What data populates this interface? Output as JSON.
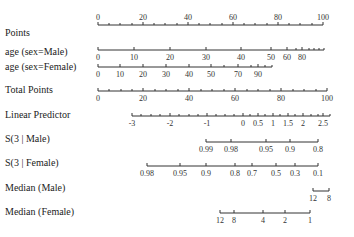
{
  "chart_data": {
    "type": "nomogram",
    "title": "",
    "axes": [
      {
        "label": "Points",
        "y": 25,
        "label_pos": "above",
        "start": 98,
        "end": 323,
        "ticks": [
          {
            "v": "0",
            "x": 98
          },
          {
            "v": "20",
            "x": 143
          },
          {
            "v": "40",
            "x": 188
          },
          {
            "v": "60",
            "x": 233
          },
          {
            "v": "80",
            "x": 278
          },
          {
            "v": "100",
            "x": 323
          }
        ],
        "minor": [
          109,
          120,
          132,
          154,
          165,
          177,
          199,
          210,
          222,
          244,
          255,
          267,
          289,
          300,
          312
        ]
      },
      {
        "label": "age (sex=Male)",
        "y": 50,
        "label_pos": "below",
        "start": 98,
        "end": 324,
        "ticks": [
          {
            "v": "0",
            "x": 98
          },
          {
            "v": "10",
            "x": 134
          },
          {
            "v": "20",
            "x": 170
          },
          {
            "v": "30",
            "x": 206
          },
          {
            "v": "40",
            "x": 241
          },
          {
            "v": "50",
            "x": 271
          },
          {
            "v": "60",
            "x": 287
          },
          {
            "v": "80",
            "x": 302
          }
        ],
        "minor": [
          296,
          309,
          314,
          319,
          324
        ]
      },
      {
        "label": "age (sex=Female)",
        "y": 67,
        "label_pos": "below",
        "start": 98,
        "end": 272,
        "ticks": [
          {
            "v": "0",
            "x": 98
          },
          {
            "v": "10",
            "x": 120
          },
          {
            "v": "20",
            "x": 143
          },
          {
            "v": "30",
            "x": 166
          },
          {
            "v": "40",
            "x": 189
          },
          {
            "v": "50",
            "x": 211
          },
          {
            "v": "70",
            "x": 238
          },
          {
            "v": "90",
            "x": 258
          }
        ],
        "minor": [
          224,
          251,
          265,
          272
        ]
      },
      {
        "label": "Total Points",
        "y": 91,
        "label_pos": "below",
        "start": 98,
        "end": 327,
        "ticks": [
          {
            "v": "0",
            "x": 98
          },
          {
            "v": "20",
            "x": 143
          },
          {
            "v": "40",
            "x": 189
          },
          {
            "v": "60",
            "x": 235
          },
          {
            "v": "80",
            "x": 281
          },
          {
            "v": "100",
            "x": 327
          }
        ],
        "minor": [
          109,
          121,
          132,
          155,
          166,
          178,
          201,
          212,
          224,
          247,
          258,
          270,
          293,
          304,
          316
        ]
      },
      {
        "label": "Linear Predictor",
        "y": 116,
        "label_pos": "below",
        "start": 132,
        "end": 330,
        "ticks": [
          {
            "v": "-3",
            "x": 132
          },
          {
            "v": "-2",
            "x": 170
          },
          {
            "v": "-1",
            "x": 207
          },
          {
            "v": "0",
            "x": 243
          },
          {
            "v": "0.5",
            "x": 258
          },
          {
            "v": "1",
            "x": 273
          },
          {
            "v": "1.5",
            "x": 288
          },
          {
            "v": "2",
            "x": 303
          },
          {
            "v": "2.5",
            "x": 323
          }
        ],
        "minor": [
          141,
          151,
          160,
          179,
          189,
          198,
          216,
          225,
          234,
          250,
          265,
          280,
          295,
          311,
          318,
          330
        ]
      },
      {
        "label": "S(3 | Male)",
        "y": 142,
        "label_pos": "below",
        "start": 206,
        "end": 318,
        "ticks": [
          {
            "v": "0.99",
            "x": 206
          },
          {
            "v": "0.98",
            "x": 231
          },
          {
            "v": "0.95",
            "x": 266
          },
          {
            "v": "0.9",
            "x": 290
          },
          {
            "v": "0.8",
            "x": 318
          }
        ],
        "minor": []
      },
      {
        "label": "S(3 | Female)",
        "y": 166,
        "label_pos": "below",
        "start": 147,
        "end": 318,
        "ticks": [
          {
            "v": "0.98",
            "x": 147
          },
          {
            "v": "0.95",
            "x": 180
          },
          {
            "v": "0.9",
            "x": 206
          },
          {
            "v": "0.8",
            "x": 235
          },
          {
            "v": "0.7",
            "x": 252
          },
          {
            "v": "0.5",
            "x": 276
          },
          {
            "v": "0.3",
            "x": 295
          },
          {
            "v": "0.1",
            "x": 318
          }
        ],
        "minor": []
      },
      {
        "label": "Median (Male)",
        "y": 191,
        "label_pos": "below",
        "start": 313,
        "end": 329,
        "ticks": [
          {
            "v": "12",
            "x": 313
          },
          {
            "v": "8",
            "x": 329
          }
        ],
        "minor": []
      },
      {
        "label": "Median (Female)",
        "y": 213,
        "label_pos": "below",
        "start": 220,
        "end": 310,
        "ticks": [
          {
            "v": "12",
            "x": 220
          },
          {
            "v": "8",
            "x": 234
          },
          {
            "v": "4",
            "x": 263
          },
          {
            "v": "2",
            "x": 285
          },
          {
            "v": "1",
            "x": 310
          }
        ],
        "minor": []
      }
    ]
  },
  "labels": {
    "points": "Points",
    "age_male": "age (sex=Male)",
    "age_female": "age (sex=Female)",
    "total_points": "Total Points",
    "linear_predictor": "Linear Predictor",
    "s3_male": "S(3 | Male)",
    "s3_female": "S(3 | Female)",
    "median_male": "Median (Male)",
    "median_female": "Median (Female)"
  }
}
